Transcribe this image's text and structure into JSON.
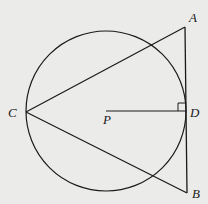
{
  "diagram": {
    "type": "geometry",
    "colors": {
      "stroke": "#1a1a1a",
      "background": "#ebebea"
    },
    "circle": {
      "center_label": "P",
      "cx": 106,
      "cy": 111,
      "r": 80
    },
    "points": {
      "A": {
        "label": "A",
        "x": 185,
        "y": 27
      },
      "B": {
        "label": "B",
        "x": 187,
        "y": 193
      },
      "C": {
        "label": "C",
        "x": 26,
        "y": 112
      },
      "D": {
        "label": "D",
        "x": 186,
        "y": 111
      },
      "P": {
        "label": "P",
        "x": 106,
        "y": 111
      }
    },
    "segments": [
      "CA",
      "CB",
      "AB",
      "PD"
    ],
    "annotations": [
      "right angle at D between PD and AB"
    ]
  }
}
